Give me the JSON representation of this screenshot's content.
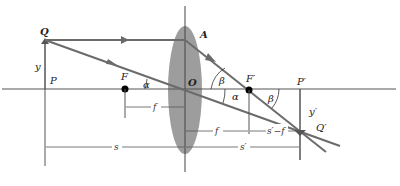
{
  "colors": {
    "ray": "#6b6b6b",
    "axis": "#555555",
    "lens": "#8c8c8c",
    "text": "#222222",
    "dot": "#000000"
  },
  "points": {
    "Q": "Q",
    "P": "P",
    "F": "F",
    "O": "O",
    "A": "A",
    "F_prime": "F′",
    "P_prime": "P′",
    "Q_prime": "Q′"
  },
  "heights": {
    "object": "y",
    "image": "y′"
  },
  "angles": {
    "alpha_left": "α",
    "alpha_right": "α",
    "beta_upper": "β",
    "beta_right": "β"
  },
  "dimensions": {
    "f_left": "f",
    "f_right": "f",
    "s_prime_minus_f": "s′−f",
    "s": "s",
    "s_prime": "s′"
  }
}
